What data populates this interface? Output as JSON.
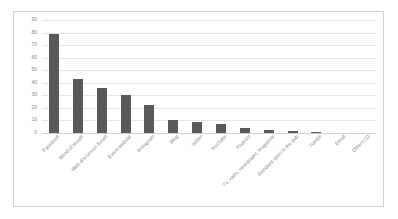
{
  "chart_data": {
    "type": "bar",
    "title": "",
    "xlabel": "",
    "ylabel": "",
    "ylim": [
      0,
      90
    ],
    "yticks": [
      0,
      10,
      20,
      30,
      40,
      50,
      60,
      70,
      80,
      90
    ],
    "grid": true,
    "legend": "none",
    "bar_color": "#5a5a5a",
    "categories": [
      "Facebook",
      "Word of mouth",
      "Web discussion forum",
      "Event website",
      "Instagram",
      "Blog",
      "twitter",
      "YouTube",
      "Podcast",
      "TV, radio, newspaper, magazine",
      "Standard sport in the pub",
      "Tumblr",
      "Email",
      "Others (1)"
    ],
    "values": [
      79,
      43,
      36,
      30,
      22,
      10,
      8.5,
      7,
      4,
      2.5,
      1.5,
      0.5,
      0,
      0
    ]
  }
}
